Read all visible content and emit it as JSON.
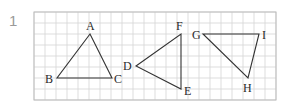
{
  "question_number": "1",
  "grid": {
    "x": 34,
    "y": 12,
    "cell": 11,
    "cols": 22,
    "rows": 8,
    "line_color": "#d4d4d4",
    "border_color": "#bdbdbd"
  },
  "triangles": [
    {
      "name": "ABC",
      "vertices": [
        {
          "label": "A",
          "x": 90,
          "y": 34,
          "lx": 86,
          "ly": 30
        },
        {
          "label": "B",
          "x": 57,
          "y": 78,
          "lx": 45,
          "ly": 83
        },
        {
          "label": "C",
          "x": 112,
          "y": 78,
          "lx": 114,
          "ly": 83
        }
      ]
    },
    {
      "name": "DEF",
      "vertices": [
        {
          "label": "D",
          "x": 136,
          "y": 66,
          "lx": 123,
          "ly": 70
        },
        {
          "label": "F",
          "x": 181,
          "y": 34,
          "lx": 176,
          "ly": 30
        },
        {
          "label": "E",
          "x": 181,
          "y": 89,
          "lx": 184,
          "ly": 95
        }
      ]
    },
    {
      "name": "GHI",
      "vertices": [
        {
          "label": "G",
          "x": 203,
          "y": 34,
          "lx": 192,
          "ly": 39
        },
        {
          "label": "I",
          "x": 259,
          "y": 34,
          "lx": 262,
          "ly": 39
        },
        {
          "label": "H",
          "x": 248,
          "y": 78,
          "lx": 243,
          "ly": 92
        }
      ]
    }
  ],
  "line_color": "#333333"
}
